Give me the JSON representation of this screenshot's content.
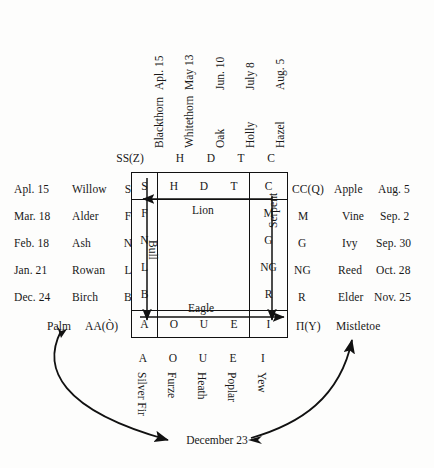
{
  "diagram": {
    "pivot_label": "December 23",
    "ink_color": "#111111",
    "background_color": "#fdfdfc"
  },
  "top": {
    "dates": [
      "Apl. 15",
      "May 13",
      "Jun. 10",
      "July 8",
      "Aug. 5"
    ],
    "trees": [
      "Blackthorn",
      "Whitethorn",
      "Oak",
      "Holly",
      "Hazel"
    ],
    "letters": [
      "SS(Z)",
      "H",
      "D",
      "T",
      "C"
    ]
  },
  "bottom": {
    "letters": [
      "A",
      "O",
      "U",
      "E",
      "I"
    ],
    "trees": [
      "Silver Fir",
      "Furze",
      "Heath",
      "Poplar",
      "Yew"
    ]
  },
  "left": {
    "rows": [
      {
        "date": "Apl. 15",
        "tree": "Willow",
        "letter": "S"
      },
      {
        "date": "Mar. 18",
        "tree": "Alder",
        "letter": "F"
      },
      {
        "date": "Feb. 18",
        "tree": "Ash",
        "letter": "N"
      },
      {
        "date": "Jan. 21",
        "tree": "Rowan",
        "letter": "L"
      },
      {
        "date": "Dec. 24",
        "tree": "Birch",
        "letter": "B"
      }
    ],
    "palm": {
      "tree": "Palm",
      "letter": "AA(Ò)"
    }
  },
  "right": {
    "rows": [
      {
        "letter": "CC(Q)",
        "tree": "Apple",
        "date": "Aug. 5"
      },
      {
        "letter": "M",
        "tree": "Vine",
        "date": "Sep. 2"
      },
      {
        "letter": "G",
        "tree": "Ivy",
        "date": "Sep. 30"
      },
      {
        "letter": "NG",
        "tree": "Reed",
        "date": "Oct. 28"
      },
      {
        "letter": "R",
        "tree": "Elder",
        "date": "Nov. 25"
      }
    ],
    "mistletoe": {
      "letter": "Π(Y)",
      "tree": "Mistletoe"
    }
  },
  "grid": {
    "top_row": [
      "S",
      "H",
      "D",
      "T",
      "C"
    ],
    "bottom_row": [
      "A",
      "O",
      "U",
      "E",
      "I"
    ],
    "left_col": [
      "S",
      "F",
      "N",
      "L",
      "B",
      "A"
    ],
    "right_col": [
      "C",
      "M",
      "G",
      "NG",
      "R",
      "I"
    ]
  },
  "seasons": {
    "top": "Lion",
    "left": "Bull",
    "right": "Serpent",
    "bottom": "Eagle"
  }
}
